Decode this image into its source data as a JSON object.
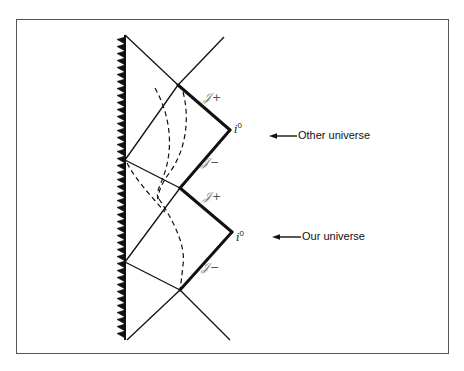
{
  "figure": {
    "type": "penrose-conformal-diagram",
    "frame": {
      "x": 16,
      "y": 19,
      "w": 433,
      "h": 335
    }
  },
  "geometry": {
    "singularity_line": {
      "x": 125,
      "y1": 35,
      "y2": 340
    },
    "zigzag": {
      "x_line": 125,
      "x_tip": 117,
      "y_start": 37,
      "y_end": 338,
      "pitch": 7
    },
    "lines": [
      {
        "id": "upper-ray",
        "x1": 125,
        "y1": 35,
        "x2": 178,
        "y2": 85
      },
      {
        "id": "upper-diag-right",
        "x1": 178,
        "y1": 85,
        "x2": 224,
        "y2": 37
      },
      {
        "id": "top-left-down",
        "x1": 125,
        "y1": 160,
        "x2": 178,
        "y2": 85
      },
      {
        "id": "upper-mid",
        "x1": 125,
        "y1": 160,
        "x2": 180,
        "y2": 188
      },
      {
        "id": "mid-left-up",
        "x1": 125,
        "y1": 262,
        "x2": 180,
        "y2": 188
      },
      {
        "id": "lower-mid",
        "x1": 125,
        "y1": 262,
        "x2": 180,
        "y2": 290
      },
      {
        "id": "bottom-left",
        "x1": 127,
        "y1": 340,
        "x2": 180,
        "y2": 290
      },
      {
        "id": "bottom-right",
        "x1": 180,
        "y1": 290,
        "x2": 230,
        "y2": 340
      }
    ],
    "heavy_lines": [
      {
        "id": "other-scri-plus",
        "x1": 178,
        "y1": 85,
        "x2": 230,
        "y2": 130
      },
      {
        "id": "other-scri-minus",
        "x1": 230,
        "y1": 130,
        "x2": 180,
        "y2": 188
      },
      {
        "id": "our-scri-plus",
        "x1": 180,
        "y1": 188,
        "x2": 232,
        "y2": 232
      },
      {
        "id": "our-scri-minus",
        "x1": 232,
        "y1": 232,
        "x2": 180,
        "y2": 290
      }
    ],
    "dashed_curves": [
      {
        "id": "worldline-a",
        "d": "M155,88 C170,115 176,150 160,185 C157,192 157,196 158,199"
      },
      {
        "id": "worldline-b",
        "d": "M183,92 C190,118 186,150 170,172 C162,183 158,192 158,199"
      },
      {
        "id": "worldline-c",
        "d": "M127,163 C136,180 150,195 165,212"
      },
      {
        "id": "worldline-d",
        "d": "M159,199 C173,220 186,245 183,265 C182,275 181,283 180,290"
      }
    ]
  },
  "labels": {
    "other_scri_plus": {
      "glyph": "𝒥",
      "sign": "+",
      "x": 203,
      "y": 91
    },
    "other_i0": {
      "glyph": "i",
      "sup": "0",
      "x": 234,
      "y": 122
    },
    "other_scri_minus": {
      "glyph": "𝒥",
      "sign": "−",
      "x": 201,
      "y": 156
    },
    "our_scri_plus": {
      "glyph": "𝒥",
      "sign": "+",
      "x": 203,
      "y": 190
    },
    "our_i0": {
      "glyph": "i",
      "sup": "0",
      "x": 236,
      "y": 230
    },
    "our_scri_minus": {
      "glyph": "𝒥",
      "sign": "−",
      "x": 201,
      "y": 261
    }
  },
  "annotations": [
    {
      "id": "other-universe",
      "text": "Other universe",
      "arrow": {
        "x1": 297,
        "x2": 269,
        "y": 136
      },
      "text_x": 298,
      "text_y": 130
    },
    {
      "id": "our-universe",
      "text": "Our universe",
      "arrow": {
        "x1": 301,
        "x2": 272,
        "y": 237
      },
      "text_x": 302,
      "text_y": 231
    }
  ],
  "colors": {
    "ink": "#111111",
    "frame": "#555555",
    "script": "#777777",
    "background": "#ffffff"
  }
}
